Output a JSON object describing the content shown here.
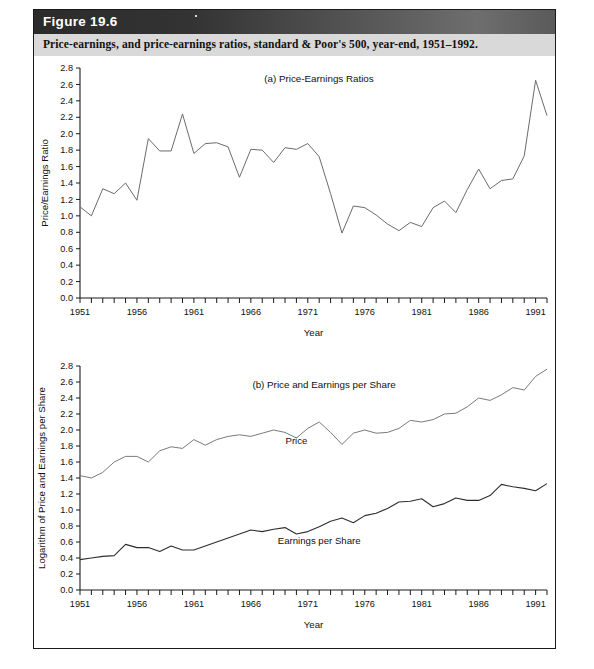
{
  "figure": {
    "number_label": "Figure 19.6",
    "caption": "Price-earnings, and price-earnings ratios, standard & Poor's 500, year-end, 1951–1992.",
    "accent_header_color": "#333333",
    "caption_bar_color": "#d9d9d9",
    "border_color": "#1a1a1a"
  },
  "chart_data": [
    {
      "type": "line",
      "panel_id": "a",
      "title": "(a) Price-Earnings Ratios",
      "xlabel": "Year",
      "ylabel": "Price/Earnings Ratio",
      "xlim": [
        1951,
        1992
      ],
      "ylim": [
        0.0,
        2.8
      ],
      "yticks": [
        "0.0",
        "0.2",
        "0.4",
        "0.6",
        "0.8",
        "1.0",
        "1.2",
        "1.4",
        "1.6",
        "1.8",
        "2.0",
        "2.2",
        "2.4",
        "2.6",
        "2.8"
      ],
      "xticks_labeled": [
        "1951",
        "1956",
        "1961",
        "1966",
        "1971",
        "1976",
        "1981",
        "1986",
        "1991"
      ],
      "xtick_every": 1,
      "grid": false,
      "legend": "none",
      "line_color": "#6b6b6b",
      "x": [
        1951,
        1952,
        1953,
        1954,
        1955,
        1956,
        1957,
        1958,
        1959,
        1960,
        1961,
        1962,
        1963,
        1964,
        1965,
        1966,
        1967,
        1968,
        1969,
        1970,
        1971,
        1972,
        1973,
        1974,
        1975,
        1976,
        1977,
        1978,
        1979,
        1980,
        1981,
        1982,
        1983,
        1984,
        1985,
        1986,
        1987,
        1988,
        1989,
        1990,
        1991,
        1992
      ],
      "values": [
        1.11,
        1.0,
        1.33,
        1.27,
        1.4,
        1.19,
        1.94,
        1.79,
        1.79,
        2.24,
        1.76,
        1.88,
        1.89,
        1.84,
        1.47,
        1.81,
        1.8,
        1.65,
        1.83,
        1.81,
        1.88,
        1.72,
        1.27,
        0.79,
        1.12,
        1.1,
        1.01,
        0.9,
        0.82,
        0.92,
        0.87,
        1.1,
        1.18,
        1.04,
        1.32,
        1.57,
        1.33,
        1.43,
        1.45,
        1.73,
        2.65,
        2.22
      ]
    },
    {
      "type": "line",
      "panel_id": "b",
      "title": "(b) Price and Earnings per Share",
      "xlabel": "Year",
      "ylabel": "Logarithm of Price and Earnings per Share",
      "xlim": [
        1951,
        1992
      ],
      "ylim": [
        0.0,
        2.8
      ],
      "yticks": [
        "0.0",
        "0.2",
        "0.4",
        "0.6",
        "0.8",
        "1.0",
        "1.2",
        "1.4",
        "1.6",
        "1.8",
        "2.0",
        "2.2",
        "2.4",
        "2.6",
        "2.8"
      ],
      "xticks_labeled": [
        "1951",
        "1956",
        "1961",
        "1966",
        "1971",
        "1976",
        "1981",
        "1986",
        "1991"
      ],
      "xtick_every": 1,
      "grid": false,
      "legend": "inline-annotations",
      "annotations": [
        {
          "text": "Price",
          "x": 1970,
          "y": 1.83
        },
        {
          "text": "Earnings per Share",
          "x": 1972,
          "y": 0.57
        }
      ],
      "x": [
        1951,
        1952,
        1953,
        1954,
        1955,
        1956,
        1957,
        1958,
        1959,
        1960,
        1961,
        1962,
        1963,
        1964,
        1965,
        1966,
        1967,
        1968,
        1969,
        1970,
        1971,
        1972,
        1973,
        1974,
        1975,
        1976,
        1977,
        1978,
        1979,
        1980,
        1981,
        1982,
        1983,
        1984,
        1985,
        1986,
        1987,
        1988,
        1989,
        1990,
        1991,
        1992
      ],
      "series": [
        {
          "name": "Price",
          "color": "#7a7a7a",
          "values": [
            1.43,
            1.4,
            1.47,
            1.6,
            1.67,
            1.67,
            1.6,
            1.74,
            1.79,
            1.77,
            1.88,
            1.81,
            1.88,
            1.92,
            1.94,
            1.92,
            1.96,
            2.0,
            1.97,
            1.9,
            2.02,
            2.1,
            1.97,
            1.82,
            1.96,
            2.0,
            1.96,
            1.97,
            2.02,
            2.12,
            2.1,
            2.13,
            2.2,
            2.21,
            2.29,
            2.4,
            2.37,
            2.44,
            2.53,
            2.5,
            2.67,
            2.76
          ]
        },
        {
          "name": "Earnings per Share",
          "color": "#2e2e2e",
          "values": [
            0.38,
            0.4,
            0.42,
            0.43,
            0.57,
            0.53,
            0.53,
            0.48,
            0.55,
            0.5,
            0.5,
            0.55,
            0.6,
            0.65,
            0.7,
            0.75,
            0.73,
            0.76,
            0.78,
            0.7,
            0.73,
            0.79,
            0.86,
            0.9,
            0.84,
            0.93,
            0.96,
            1.02,
            1.1,
            1.11,
            1.14,
            1.04,
            1.08,
            1.15,
            1.12,
            1.12,
            1.18,
            1.32,
            1.29,
            1.27,
            1.24,
            1.33
          ]
        }
      ]
    }
  ]
}
